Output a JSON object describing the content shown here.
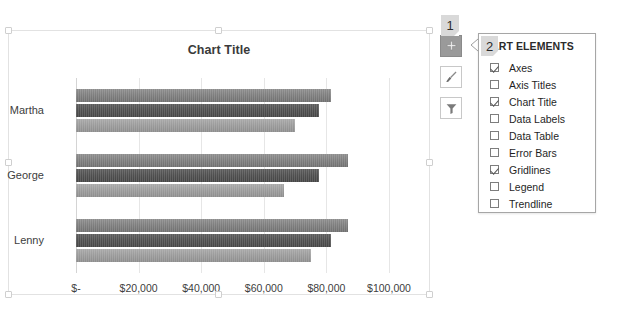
{
  "chart": {
    "title": "Chart Title",
    "categories": [
      "Martha",
      "George",
      "Lenny"
    ],
    "axis_ticks": [
      "$-",
      "$20,000",
      "$40,000",
      "$60,000",
      "$80,000",
      "$100,000"
    ]
  },
  "chart_data": {
    "type": "bar",
    "orientation": "horizontal",
    "title": "Chart Title",
    "xlabel": "",
    "ylabel": "",
    "categories": [
      "Martha",
      "George",
      "Lenny"
    ],
    "series": [
      {
        "name": "Series 1",
        "color": "#7d7d7d",
        "values": [
          81500,
          87000,
          87000
        ]
      },
      {
        "name": "Series 2",
        "color": "#4e4e4e",
        "values": [
          77500,
          77500,
          81500
        ]
      },
      {
        "name": "Series 3",
        "color": "#9a9a9a",
        "values": [
          70000,
          66500,
          75000
        ]
      }
    ],
    "xlim": [
      0,
      100000
    ],
    "xtick_values": [
      0,
      20000,
      40000,
      60000,
      80000,
      100000
    ],
    "xtick_labels": [
      "$-",
      "$20,000",
      "$40,000",
      "$60,000",
      "$80,000",
      "$100,000"
    ],
    "grid": true,
    "legend": false,
    "legend_position": "none",
    "data_labels": false
  },
  "callouts": [
    {
      "id": "1",
      "label": "1"
    },
    {
      "id": "2",
      "label": "2"
    }
  ],
  "side_buttons": [
    {
      "icon": "plus-icon",
      "name": "chart-elements-button",
      "active": true
    },
    {
      "icon": "paintbrush-icon",
      "name": "chart-styles-button",
      "active": false
    },
    {
      "icon": "funnel-icon",
      "name": "chart-filters-button",
      "active": false
    }
  ],
  "panel": {
    "title": "CHART ELEMENTS",
    "title_visible": "IART ELEMENTS",
    "items": [
      {
        "label": "Axes",
        "checked": true
      },
      {
        "label": "Axis Titles",
        "checked": false
      },
      {
        "label": "Chart Title",
        "checked": true
      },
      {
        "label": "Data Labels",
        "checked": false
      },
      {
        "label": "Data Table",
        "checked": false
      },
      {
        "label": "Error Bars",
        "checked": false
      },
      {
        "label": "Gridlines",
        "checked": true
      },
      {
        "label": "Legend",
        "checked": false
      },
      {
        "label": "Trendline",
        "checked": false
      }
    ]
  }
}
